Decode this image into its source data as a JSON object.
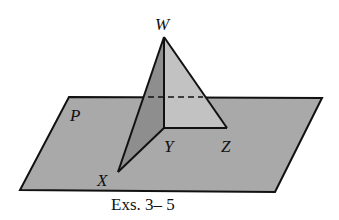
{
  "figure": {
    "plane_label": "P",
    "vertices": {
      "W": "W",
      "X": "X",
      "Y": "Y",
      "Z": "Z"
    },
    "caption": "Exs. 3– 5"
  },
  "colors": {
    "plane_fill": "#a9a9a9",
    "face_wyz": "#c2c2c2",
    "face_wxy": "#8e8e8e",
    "stroke": "#111111"
  }
}
